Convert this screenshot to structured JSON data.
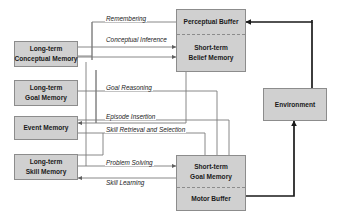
{
  "figure": {
    "colors": {
      "box_fill": "#d0d0d0",
      "box_stroke": "#8c8c8c",
      "thin_line": "#7a7a7a",
      "thick_line": "#1a1a1a",
      "background": "#ffffff",
      "text": "#1a1a1a"
    }
  },
  "boxes": {
    "conceptual_memory": {
      "line1": "Long-term",
      "line2": "Conceptual Memory"
    },
    "goal_memory": {
      "line1": "Long-term",
      "line2": "Goal Memory"
    },
    "event_memory": {
      "line1": "Event Memory",
      "line2": ""
    },
    "skill_memory": {
      "line1": "Long-term",
      "line2": "Skill Memory"
    },
    "perceptual_buffer": {
      "line1": "Perceptual Buffer",
      "line2": ""
    },
    "belief_memory": {
      "line1": "Short-term",
      "line2": "Belief Memory"
    },
    "short_term_goal_memory": {
      "line1": "Short-term",
      "line2": "Goal Memory"
    },
    "motor_buffer": {
      "line1": "Motor Buffer",
      "line2": ""
    },
    "environment": {
      "line1": "Environment",
      "line2": ""
    }
  },
  "edge_labels": {
    "remembering": "Remembering",
    "conceptual_inference": "Conceptual Inference",
    "goal_reasoning": "Goal Reasoning",
    "episode_insertion": "Episode Insertion",
    "skill_retrieval": "Skill Retrieval and Selection",
    "problem_solving": "Problem Solving",
    "skill_learning": "Skill Learning"
  }
}
